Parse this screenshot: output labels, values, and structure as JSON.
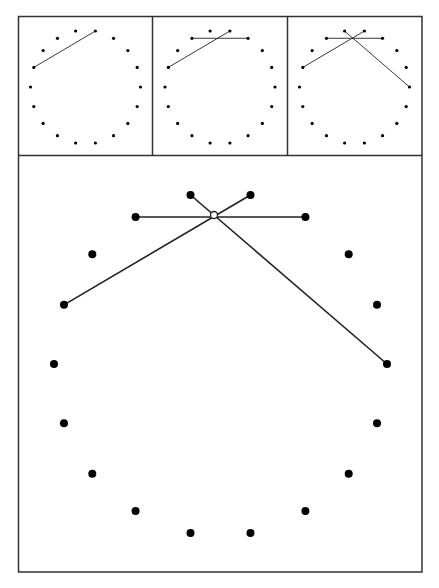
{
  "figure": {
    "colors": {
      "stroke": "#222222",
      "dot": "#000000",
      "background": "#ffffff",
      "intersection_fill": "#ffffff"
    },
    "points_normalized": [
      [
        -0.18,
        -1.0
      ],
      [
        0.18,
        -1.0
      ],
      [
        0.51,
        -0.87
      ],
      [
        0.77,
        -0.65
      ],
      [
        0.94,
        -0.35
      ],
      [
        1.0,
        0.0
      ],
      [
        0.94,
        0.35
      ],
      [
        0.77,
        0.65
      ],
      [
        0.51,
        0.87
      ],
      [
        0.18,
        1.0
      ],
      [
        -0.18,
        1.0
      ],
      [
        -0.51,
        0.87
      ],
      [
        -0.77,
        0.65
      ],
      [
        -0.94,
        0.35
      ],
      [
        -1.0,
        0.0
      ],
      [
        -0.94,
        -0.35
      ],
      [
        -0.77,
        -0.65
      ],
      [
        -0.51,
        -0.87
      ]
    ],
    "panels": [
      {
        "name": "step-1",
        "segments": [
          [
            15,
            1
          ]
        ],
        "intersection": null
      },
      {
        "name": "step-2",
        "segments": [
          [
            15,
            1
          ],
          [
            17,
            2
          ]
        ],
        "intersection": null
      },
      {
        "name": "step-3",
        "segments": [
          [
            15,
            1
          ],
          [
            17,
            2
          ],
          [
            0,
            5
          ]
        ],
        "intersection": null
      },
      {
        "name": "enlarged",
        "segments": [
          [
            15,
            1
          ],
          [
            17,
            2
          ],
          [
            0,
            5
          ]
        ],
        "intersection": [
          214,
          215
        ]
      }
    ]
  }
}
